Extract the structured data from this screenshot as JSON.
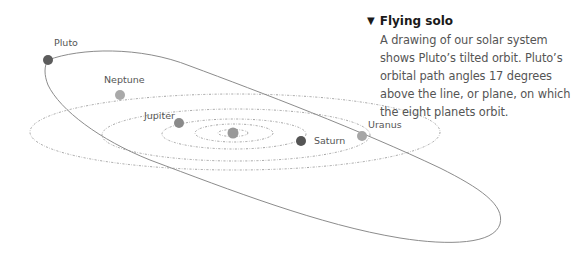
{
  "caption": {
    "heading_icon": "▼",
    "heading": "Flying solo",
    "body": "A drawing of our solar system shows Pluto’s tilted orbit. Pluto’s orbital path angles 17 degrees above the line, or plane, on which the eight planets orbit."
  },
  "planets": {
    "pluto": {
      "label": "Pluto",
      "color": "#5c5c5c"
    },
    "neptune": {
      "label": "Neptune",
      "color": "#a9a9a9"
    },
    "jupiter": {
      "label": "Jupiter",
      "color": "#8a8a8a"
    },
    "saturn": {
      "label": "Saturn",
      "color": "#555555"
    },
    "uranus": {
      "label": "Uranus",
      "color": "#a6a6a6"
    },
    "sun": {
      "color": "#999999"
    }
  },
  "colors": {
    "orbit_line": "#999999",
    "pluto_orbit": "#8c8c8c",
    "text": "#555555",
    "heading": "#1a1a1a"
  }
}
